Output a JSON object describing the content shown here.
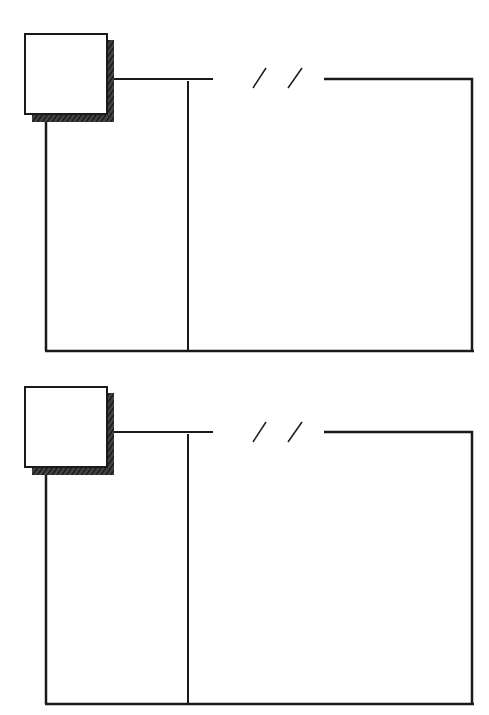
{
  "document": {
    "type": "sketch-template",
    "description": "Two identical hand-drawn story panels, each with a shaded square label box, a break-marked top rule, and a two-column frame"
  },
  "colors": {
    "line": "#1a1a1a",
    "shadow": "#2a2a2a",
    "background": "#ffffff"
  },
  "panels": [
    {
      "id": "panel-1",
      "offset_y": 0,
      "label_box_text": "",
      "break_marker": "/ /"
    },
    {
      "id": "panel-2",
      "offset_y": 353,
      "label_box_text": "",
      "break_marker": "/ /"
    }
  ]
}
